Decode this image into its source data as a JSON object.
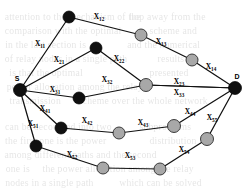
{
  "figure": {
    "type": "node-link-diagram",
    "endpoints": {
      "source_label": "S",
      "destination_label": "D"
    },
    "colors": {
      "edge": "#111111",
      "node_black": "#101010",
      "node_gray": "#a8a8a8",
      "background": "#ffffff",
      "label_text": "#000000"
    },
    "nodes": [
      {
        "id": "S",
        "label": "S",
        "fill": "black",
        "x": 20,
        "y": 90,
        "r": 6.5
      },
      {
        "id": "D",
        "label": "D",
        "fill": "black",
        "x": 235,
        "y": 88,
        "r": 6.5
      },
      {
        "id": "n1",
        "label": "",
        "fill": "black",
        "x": 69,
        "y": 17,
        "r": 6.0
      },
      {
        "id": "n2",
        "label": "",
        "fill": "gray",
        "x": 141,
        "y": 35,
        "r": 6.0
      },
      {
        "id": "n3",
        "label": "",
        "fill": "gray",
        "x": 192,
        "y": 60,
        "r": 6.0
      },
      {
        "id": "n4",
        "label": "",
        "fill": "black",
        "x": 96,
        "y": 48,
        "r": 6.0
      },
      {
        "id": "n5",
        "label": "",
        "fill": "gray",
        "x": 146,
        "y": 85,
        "r": 6.5
      },
      {
        "id": "n6",
        "label": "",
        "fill": "black",
        "x": 79,
        "y": 98,
        "r": 6.0
      },
      {
        "id": "n7",
        "label": "",
        "fill": "black",
        "x": 61,
        "y": 128,
        "r": 6.0
      },
      {
        "id": "n8",
        "label": "",
        "fill": "gray",
        "x": 119,
        "y": 133,
        "r": 6.0
      },
      {
        "id": "n9",
        "label": "",
        "fill": "gray",
        "x": 174,
        "y": 126,
        "r": 6.5
      },
      {
        "id": "n10",
        "label": "",
        "fill": "gray",
        "x": 207,
        "y": 139,
        "r": 6.5
      },
      {
        "id": "n11",
        "label": "",
        "fill": "black",
        "x": 36,
        "y": 146,
        "r": 6.0
      },
      {
        "id": "n12",
        "label": "",
        "fill": "gray",
        "x": 103,
        "y": 168,
        "r": 6.0
      },
      {
        "id": "n13",
        "label": "",
        "fill": "gray",
        "x": 160,
        "y": 169,
        "r": 6.0
      }
    ],
    "edges": [
      {
        "id": "e11",
        "from": "S",
        "to": "n1",
        "label": "X",
        "sub": "11",
        "lx": 40,
        "ly": 46
      },
      {
        "id": "e12",
        "from": "n1",
        "to": "n2",
        "label": "X",
        "sub": "12",
        "lx": 99,
        "ly": 19
      },
      {
        "id": "e13",
        "from": "n2",
        "to": "n3",
        "label": "X",
        "sub": "13",
        "lx": 161,
        "ly": 44
      },
      {
        "id": "e14",
        "from": "n3",
        "to": "D",
        "label": "X",
        "sub": "14",
        "lx": 211,
        "ly": 69
      },
      {
        "id": "e21",
        "from": "S",
        "to": "n4",
        "label": "X",
        "sub": "21",
        "lx": 59,
        "ly": 62
      },
      {
        "id": "e22",
        "from": "n4",
        "to": "n5",
        "label": "X",
        "sub": "22",
        "lx": 119,
        "ly": 61
      },
      {
        "id": "e23",
        "from": "n5",
        "to": "D",
        "label": "X",
        "sub": "23",
        "lx": 179,
        "ly": 84
      },
      {
        "id": "e31",
        "from": "S",
        "to": "n6",
        "label": "X",
        "sub": "31",
        "lx": 55,
        "ly": 92
      },
      {
        "id": "e32",
        "from": "n6",
        "to": "n5",
        "label": "X",
        "sub": "32",
        "lx": 107,
        "ly": 82
      },
      {
        "id": "e33",
        "from": "n5",
        "to": "D",
        "label": "X",
        "sub": "33",
        "lx": 179,
        "ly": 95
      },
      {
        "id": "e41",
        "from": "S",
        "to": "n7",
        "label": "X",
        "sub": "41",
        "lx": 45,
        "ly": 111
      },
      {
        "id": "e42",
        "from": "n7",
        "to": "n8",
        "label": "X",
        "sub": "42",
        "lx": 87,
        "ly": 123
      },
      {
        "id": "e43",
        "from": "n8",
        "to": "n9",
        "label": "X",
        "sub": "43",
        "lx": 143,
        "ly": 125
      },
      {
        "id": "e44",
        "from": "n9",
        "to": "D",
        "label": "X",
        "sub": "44",
        "lx": 190,
        "ly": 114
      },
      {
        "id": "e51",
        "from": "S",
        "to": "n11",
        "label": "X",
        "sub": "51",
        "lx": 33,
        "ly": 126
      },
      {
        "id": "e52",
        "from": "n11",
        "to": "n12",
        "label": "X",
        "sub": "52",
        "lx": 72,
        "ly": 157
      },
      {
        "id": "e53",
        "from": "n12",
        "to": "n13",
        "label": "X",
        "sub": "53",
        "lx": 130,
        "ly": 158
      },
      {
        "id": "e54",
        "from": "n13",
        "to": "n10",
        "label": "X",
        "sub": "54",
        "lx": 184,
        "ly": 152
      },
      {
        "id": "e55",
        "from": "n10",
        "to": "D",
        "label": "X",
        "sub": "55",
        "lx": 212,
        "ly": 120
      }
    ],
    "background_bleed": [
      {
        "text": "attention to the mechanism of the",
        "x": 6,
        "y": 12
      },
      {
        "text": "hop away from the",
        "x": 130,
        "y": 12
      },
      {
        "text": "comparison with the optimal",
        "x": 6,
        "y": 26
      },
      {
        "text": "scheme and",
        "x": 150,
        "y": 26
      },
      {
        "text": "in the last section is",
        "x": 6,
        "y": 40
      },
      {
        "text": "and the numerical",
        "x": 128,
        "y": 40
      },
      {
        "text": "of relay nodes in a single path",
        "x": 6,
        "y": 54
      },
      {
        "text": "results are",
        "x": 158,
        "y": 54
      },
      {
        "text": "is that the optimal",
        "x": 10,
        "y": 68
      },
      {
        "text": "presented",
        "x": 150,
        "y": 68
      },
      {
        "text": "power allocation among the relay",
        "x": 8,
        "y": 82
      },
      {
        "text": "transmission",
        "x": 10,
        "y": 96
      },
      {
        "text": "scheme over the whole network",
        "x": 80,
        "y": 96
      },
      {
        "text": "can be decoupled into two",
        "x": 6,
        "y": 122
      },
      {
        "text": "subproblems",
        "x": 140,
        "y": 122
      },
      {
        "text": "the first one is the power",
        "x": 6,
        "y": 136
      },
      {
        "text": "distribution",
        "x": 150,
        "y": 136
      },
      {
        "text": "among different paths and the second",
        "x": 6,
        "y": 150
      },
      {
        "text": "one is",
        "x": 6,
        "y": 164
      },
      {
        "text": "the power allocation among the relay",
        "x": 44,
        "y": 164
      },
      {
        "text": "nodes in a single path",
        "x": 6,
        "y": 178
      },
      {
        "text": "which can be solved",
        "x": 120,
        "y": 178
      }
    ]
  }
}
